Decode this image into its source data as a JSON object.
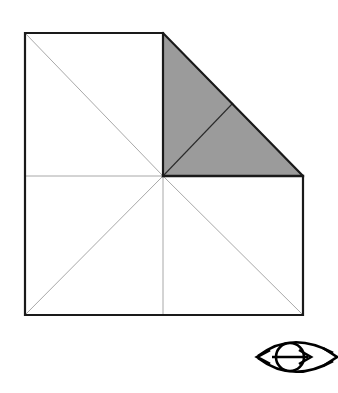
{
  "figure": {
    "canvas": {
      "width": 338,
      "height": 393,
      "background": "#ffffff"
    },
    "colors": {
      "outline": "#1a1a1a",
      "thin_line": "#9e9e9e",
      "shade_fill": "#9b9b9b",
      "shade_edge": "#1a1a1a",
      "symbol": "#000000",
      "background": "#ffffff"
    },
    "strokes": {
      "outline_width": 2.2,
      "thin_width": 0.9,
      "symbol_width": 2.6
    },
    "points": {
      "top_left": [
        25,
        33
      ],
      "top_mid": [
        163,
        33
      ],
      "mid_left": [
        25,
        176
      ],
      "center": [
        163,
        176
      ],
      "mid_right": [
        303,
        176
      ],
      "bottom_left": [
        25,
        315
      ],
      "bottom_mid": [
        163,
        315
      ],
      "bottom_right": [
        303,
        315
      ],
      "hypotenuse_mid": [
        233,
        103
      ]
    },
    "parts": [
      {
        "name": "upper-left-square",
        "label": "Upper left square",
        "corners": "25,33 163,33 163,176 25,176",
        "shaded": "no",
        "diagonal": "25,33 163,176"
      },
      {
        "name": "shaded-triangle",
        "label": "Shaded right triangle",
        "corners": "163,33 303,176 163,176",
        "shaded": "yes",
        "internal_line": "163,176 233,103"
      },
      {
        "name": "lower-left-square",
        "label": "Lower left square",
        "corners": "25,176 163,176 163,315 25,315",
        "shaded": "no",
        "diagonal": "25,315 163,176"
      },
      {
        "name": "lower-right-square",
        "label": "Lower right square",
        "corners": "163,176 303,176 303,315 163,315",
        "shaded": "no",
        "diagonal": "163,176 303,315"
      }
    ],
    "geometry_paths": {
      "outer_boundary": "M 25 33 L 163 33 L 303 176 L 303 315 L 25 315 Z",
      "shade_triangle": "M 163 33 L 303 176 L 163 176 Z",
      "thin_diagonal_ul": "M 25 33 L 163 176",
      "thin_diagonal_ll": "M 25 315 L 163 176",
      "thin_diagonal_lr": "M 163 176 L 303 315",
      "thin_horizontal_left": "M 25 176 L 163 176",
      "thin_vertical_lower": "M 163 176 L 163 315",
      "thin_vertical_upper": "M 163 33 L 163 176",
      "triangle_internal": "M 163 176 L 233 103",
      "heavy_horizontal_right": "M 163 176 L 303 176"
    },
    "symbol": {
      "name": "rotation-axis-symbol",
      "label": "Double headed arrow through circle (eye symbol)",
      "circle_center": [
        290,
        357
      ],
      "circle_radius": 14,
      "axis_line": "M 272 357 L 308 357",
      "upper_arc": "M 257 355 Q 290 331 334 354",
      "lower_arc": "M 257 359 Q 290 383 334 360",
      "arrow_left": [
        258,
        357
      ],
      "arrow_right_inner": [
        310,
        357
      ],
      "arrow_right_outer": [
        336,
        357
      ]
    }
  }
}
